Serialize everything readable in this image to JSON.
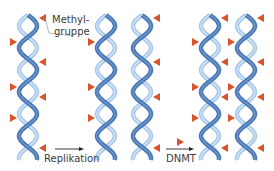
{
  "labels": {
    "methyl_line1": "Methyl-",
    "methyl_line2": "gruppe",
    "replication": "Replikation",
    "dnmt": "DNMT"
  },
  "colors": {
    "strand_dark": "#4a78b5",
    "strand_light": "#a9c8ea",
    "methyl": "#d9532b",
    "arrow": "#222222",
    "text": "#3b3b3b"
  },
  "helices": [
    {
      "name": "parent",
      "x": 28,
      "left_marks": [
        42,
        87,
        118
      ],
      "right_marks": [
        18,
        62,
        97,
        148
      ]
    },
    {
      "name": "daughter-1",
      "x": 106,
      "left_marks": [
        42,
        87,
        118
      ],
      "right_marks": []
    },
    {
      "name": "daughter-2",
      "x": 142,
      "left_marks": [],
      "right_marks": [
        18,
        62,
        97,
        148
      ]
    },
    {
      "name": "remethylated-1",
      "x": 210,
      "left_marks": [
        42,
        87,
        118
      ],
      "right_marks": [
        18,
        62,
        97,
        148
      ]
    },
    {
      "name": "remethylated-2",
      "x": 246,
      "left_marks": [
        42,
        87,
        118
      ],
      "right_marks": [
        18,
        62,
        97,
        148
      ]
    }
  ]
}
